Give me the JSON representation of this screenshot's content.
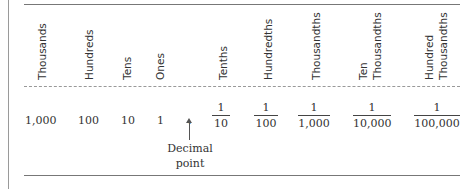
{
  "headers": [
    "Thousands",
    "Hundreds",
    "Tens",
    "Ones",
    "Tenths",
    "Hundredths",
    "Thousandths",
    "Ten Thousandths",
    "Hundred Thousandths"
  ],
  "header_lines": {
    "ten_thousandths": [
      "Ten",
      "Thousandths"
    ],
    "hundred_thousandths": [
      "Hundred",
      "Thousandths"
    ]
  },
  "values": [
    "1,000",
    "100",
    "10",
    "1"
  ],
  "decimal_point": ".",
  "fractions": [
    {
      "num": "1",
      "den": "10"
    },
    {
      "num": "1",
      "den": "100"
    },
    {
      "num": "1",
      "den": "1,000"
    },
    {
      "num": "1",
      "den": "10,000"
    },
    {
      "num": "1",
      "den": "100,000"
    }
  ],
  "annotation": {
    "line1": "Decimal",
    "line2": "point"
  }
}
